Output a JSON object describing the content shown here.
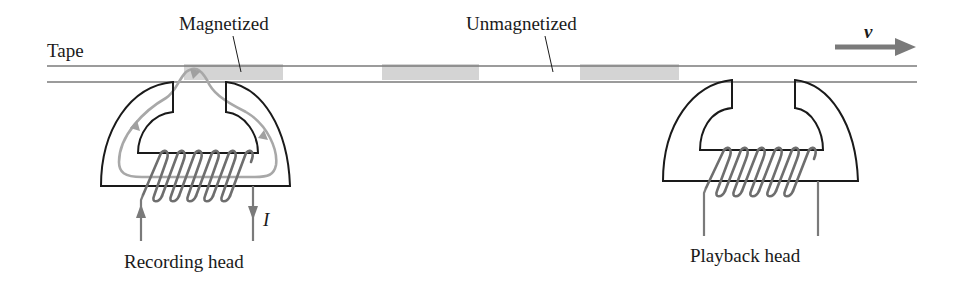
{
  "labels": {
    "tape": "Tape",
    "magnetized": "Magnetized",
    "unmagnetized": "Unmagnetized",
    "velocity": "v",
    "current": "I",
    "recording_head": "Recording head",
    "playback_head": "Playback head"
  },
  "colors": {
    "outline": "#1a1a1a",
    "gray_line": "#7a7a7a",
    "field_line": "#a8a8a8",
    "magnetized_fill": "#d4d4d4",
    "background": "#ffffff"
  },
  "tape": {
    "magnetized_regions": 3,
    "direction": "right"
  }
}
